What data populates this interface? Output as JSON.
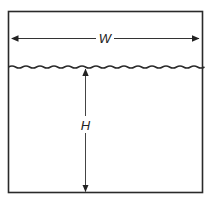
{
  "diagram": {
    "labels": {
      "width": "W",
      "height": "H"
    },
    "colors": {
      "stroke": "#2a2a2a",
      "arrow": "#333333",
      "background": "#ffffff"
    },
    "container": {
      "x": 8,
      "y": 11,
      "width": 195,
      "height": 182
    },
    "liquid_surface_y": 67,
    "width_dimension": {
      "y": 38,
      "x1": 12,
      "x2": 199
    },
    "height_dimension": {
      "x": 85,
      "y1": 69,
      "y2": 192
    }
  }
}
